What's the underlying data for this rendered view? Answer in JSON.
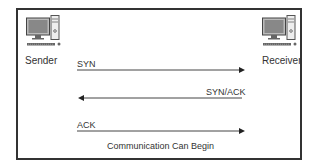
{
  "diagram": {
    "nodes": [
      {
        "id": "sender",
        "label": "Sender",
        "icon": "desktop-computer-icon"
      },
      {
        "id": "receiver",
        "label": "Receiver",
        "icon": "desktop-computer-icon"
      }
    ],
    "messages": [
      {
        "label": "SYN",
        "from": "sender",
        "to": "receiver"
      },
      {
        "label": "SYN/ACK",
        "from": "receiver",
        "to": "sender"
      },
      {
        "label": "ACK",
        "from": "sender",
        "to": "receiver"
      }
    ],
    "footer": "Communication Can Begin"
  },
  "colors": {
    "border": "#333333",
    "line": "#444444",
    "text": "#333333"
  }
}
